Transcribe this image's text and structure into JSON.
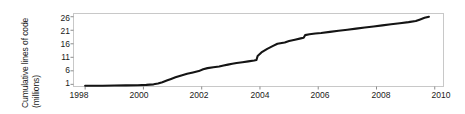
{
  "chart_data": {
    "type": "line",
    "title": "",
    "xlabel": "",
    "ylabel_line1": "Cumulative lines of code",
    "ylabel_line2": "(millions)",
    "ylabel": "Cumulative lines of code (millions)",
    "grid": false,
    "legend": "none",
    "xlim": [
      1997.6,
      2010.3
    ],
    "ylim": [
      0.2,
      27.2
    ],
    "xticks": [
      1998,
      2000,
      2002,
      2004,
      2006,
      2008,
      2010
    ],
    "xtick_labels": [
      "1998",
      "2000",
      "2002",
      "2004",
      "2006",
      "2008",
      "2010"
    ],
    "yticks": [
      1,
      6,
      11,
      16,
      21,
      26
    ],
    "ytick_labels": [
      "1",
      "6",
      "11",
      "16",
      "21",
      "26"
    ],
    "line_color": "#141414",
    "frame_color": "#c8c8c8",
    "series": [
      {
        "name": "Cumulative lines of code",
        "x": [
          1998.0,
          1998.3,
          1998.6,
          1999.0,
          1999.4,
          1999.8,
          2000.1,
          2000.35,
          2000.5,
          2000.65,
          2000.8,
          2000.95,
          2001.1,
          2001.3,
          2001.5,
          2001.7,
          2001.9,
          2002.05,
          2002.2,
          2002.4,
          2002.6,
          2002.75,
          2002.9,
          2003.05,
          2003.2,
          2003.4,
          2003.6,
          2003.8,
          2003.88,
          2003.92,
          2004.05,
          2004.25,
          2004.45,
          2004.6,
          2004.75,
          2004.85,
          2005.0,
          2005.2,
          2005.4,
          2005.5,
          2005.55,
          2005.7,
          2005.9,
          2006.1,
          2006.4,
          2006.7,
          2007.0,
          2007.3,
          2007.6,
          2007.9,
          2008.2,
          2008.5,
          2008.8,
          2009.1,
          2009.35,
          2009.5,
          2009.65,
          2009.8
        ],
        "y": [
          0.5,
          0.5,
          0.5,
          0.55,
          0.6,
          0.65,
          0.8,
          1.0,
          1.3,
          1.8,
          2.4,
          3.0,
          3.6,
          4.3,
          4.9,
          5.4,
          5.9,
          6.6,
          7.0,
          7.3,
          7.6,
          8.0,
          8.3,
          8.6,
          8.9,
          9.2,
          9.5,
          9.8,
          10.0,
          11.5,
          12.8,
          14.1,
          15.2,
          16.0,
          16.3,
          16.5,
          17.0,
          17.5,
          18.0,
          18.2,
          19.2,
          19.5,
          19.8,
          20.0,
          20.4,
          20.8,
          21.2,
          21.6,
          22.0,
          22.4,
          22.8,
          23.2,
          23.6,
          24.0,
          24.4,
          25.0,
          25.6,
          26.0
        ]
      }
    ]
  }
}
